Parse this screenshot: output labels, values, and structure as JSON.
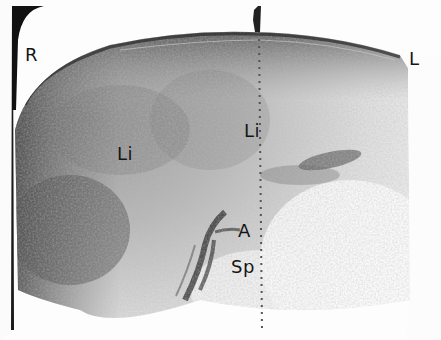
{
  "image": {
    "description": "Grayscale ultrasound sector scan (transverse abdominal view)",
    "background": "#fdfdfd",
    "tissue_dark": "#3a3a3a",
    "tissue_mid": "#8a8a8a",
    "tissue_light": "#d8d8d8"
  },
  "labels": {
    "right": "R",
    "left": "L",
    "liver_left": "Li",
    "liver_center": "Li",
    "aorta": "A",
    "spine": "Sp"
  }
}
